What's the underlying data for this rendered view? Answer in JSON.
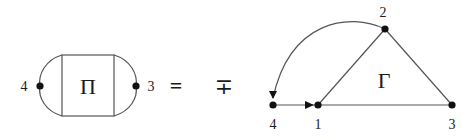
{
  "left_diagram": {
    "box_symbol": "Π",
    "left_node_label": "4",
    "right_node_label": "3"
  },
  "equals_sign": "=",
  "sign_symbol": "∓",
  "right_diagram": {
    "region_symbol": "Γ",
    "nodes": [
      {
        "id": "1",
        "label": "1"
      },
      {
        "id": "2",
        "label": "2"
      },
      {
        "id": "3",
        "label": "3"
      },
      {
        "id": "4",
        "label": "4"
      }
    ]
  },
  "colors": {
    "stroke": "#555555",
    "node": "#111111",
    "text": "#1a1a1a"
  }
}
